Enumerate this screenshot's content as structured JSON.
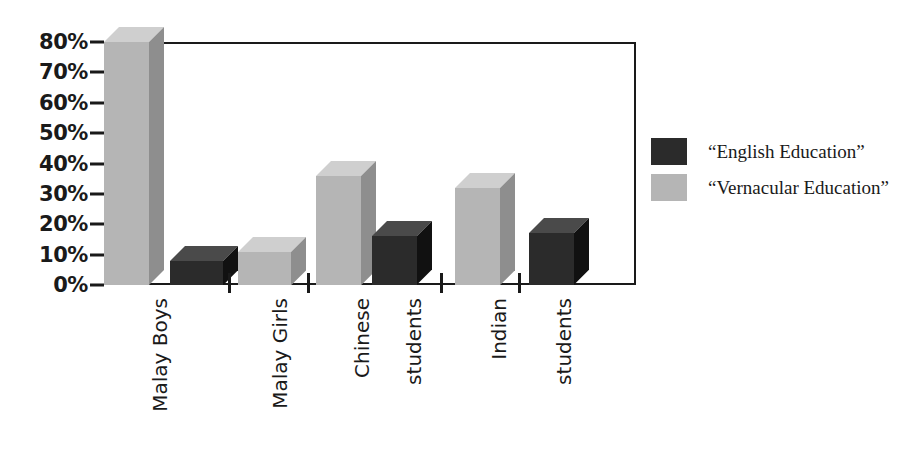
{
  "chart_data": {
    "type": "bar",
    "title": "",
    "subtitle": "",
    "xlabel": "",
    "ylabel": "",
    "ylim": [
      0,
      80
    ],
    "grid": false,
    "legend_position": "right",
    "categories": [
      "Malay Boys",
      "Malay Girls",
      "Chinese students",
      "Indian students"
    ],
    "x_tick_labels": [
      "Malay Boys",
      "Malay Girls",
      "Chinese",
      "students",
      "Indian",
      "students"
    ],
    "y_tick_labels": [
      "80%",
      "70%",
      "60%",
      "50%",
      "40%",
      "30%",
      "20%",
      "10%",
      "0%"
    ],
    "y_tick_values": [
      80,
      70,
      60,
      50,
      40,
      30,
      20,
      10,
      0
    ],
    "series": [
      {
        "name": "“English Education”",
        "color": "#2b2b2b",
        "values": [
          8,
          11,
          16,
          17
        ]
      },
      {
        "name": "“Vernacular Education”",
        "color": "#b5b5b5",
        "values": [
          80,
          12,
          36,
          32
        ]
      }
    ],
    "bars": [
      {
        "label": "Malay Boys",
        "series": "“Vernacular Education”",
        "value": 80,
        "value_label": "80%"
      },
      {
        "label": "Malay Boys",
        "series": "“English Education”",
        "value": 8,
        "value_label": "8%"
      },
      {
        "label": "Malay Girls",
        "series": "“Vernacular Education”",
        "value": 11,
        "value_label": "11%"
      },
      {
        "label": "Chinese students",
        "series": "“Vernacular Education”",
        "value": 36,
        "value_label": "36%"
      },
      {
        "label": "Chinese students",
        "series": "“English Education”",
        "value": 16,
        "value_label": "16%"
      },
      {
        "label": "Indian students",
        "series": "“Vernacular Education”",
        "value": 32,
        "value_label": "32%"
      },
      {
        "label": "Indian students",
        "series": "“English Education”",
        "value": 17,
        "value_label": "17%"
      }
    ]
  },
  "legend": {
    "items": [
      {
        "label": "“English Education”",
        "color": "#2b2b2b"
      },
      {
        "label": "“Vernacular Education”",
        "color": "#b5b5b5"
      }
    ]
  },
  "axis": {
    "y_labels": [
      "80%",
      "70%",
      "60%",
      "50%",
      "40%",
      "30%",
      "20%",
      "10%",
      "0%"
    ],
    "x_labels": [
      "Malay Boys",
      "Malay Girls",
      "Chinese",
      "students",
      "Indian",
      "students"
    ]
  },
  "colors": {
    "dark_front": "#2b2b2b",
    "dark_side": "#111111",
    "dark_top": "#4a4a4a",
    "light_front": "#b5b5b5",
    "light_side": "#8e8e8e",
    "light_top": "#cfcfcf",
    "axis": "#1a1a1a",
    "background": "#ffffff"
  }
}
